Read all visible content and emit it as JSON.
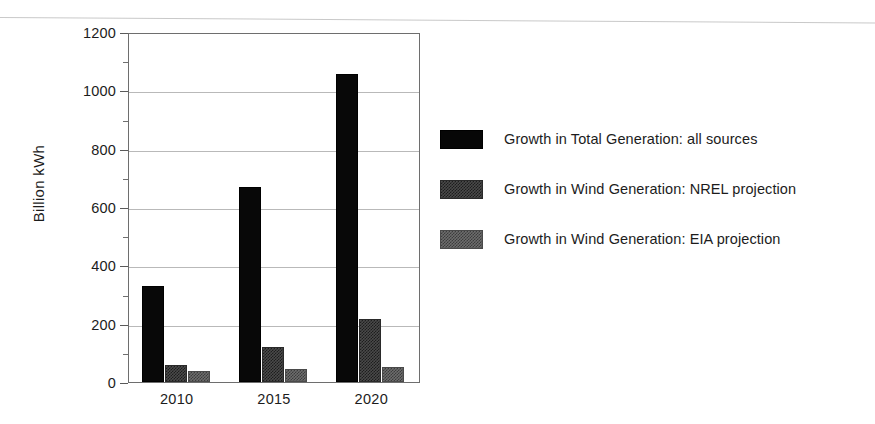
{
  "chart_data": {
    "type": "bar",
    "title": "",
    "xlabel": "",
    "ylabel": "Billion kWh",
    "categories": [
      "2010",
      "2015",
      "2020"
    ],
    "ylim": [
      0,
      1200
    ],
    "yticks": [
      0,
      200,
      400,
      600,
      800,
      1000,
      1200
    ],
    "ytick_labels": [
      "0",
      "200",
      "400",
      "600",
      "800",
      "1000",
      "1200"
    ],
    "yminor_ticks": [
      100,
      300,
      500,
      700,
      900,
      1100
    ],
    "grid": true,
    "grid_axis": "y",
    "legend_position": "right",
    "series": [
      {
        "name": "Growth in Total Generation: all sources",
        "color": "#080808",
        "values": [
          330,
          670,
          1055
        ]
      },
      {
        "name": "Growth in Wind Generation: NREL projection",
        "color": "#4a4a4a",
        "values": [
          60,
          120,
          215
        ]
      },
      {
        "name": "Growth in Wind Generation: EIA projection",
        "color": "#6d6d6d",
        "values": [
          38,
          45,
          50
        ]
      }
    ]
  },
  "legend": {
    "items": [
      {
        "label": "Growth in Total Generation: all sources",
        "swatch": "total"
      },
      {
        "label": "Growth in Wind Generation: NREL projection",
        "swatch": "nrel"
      },
      {
        "label": "Growth in Wind Generation: EIA projection",
        "swatch": "eia"
      }
    ]
  }
}
